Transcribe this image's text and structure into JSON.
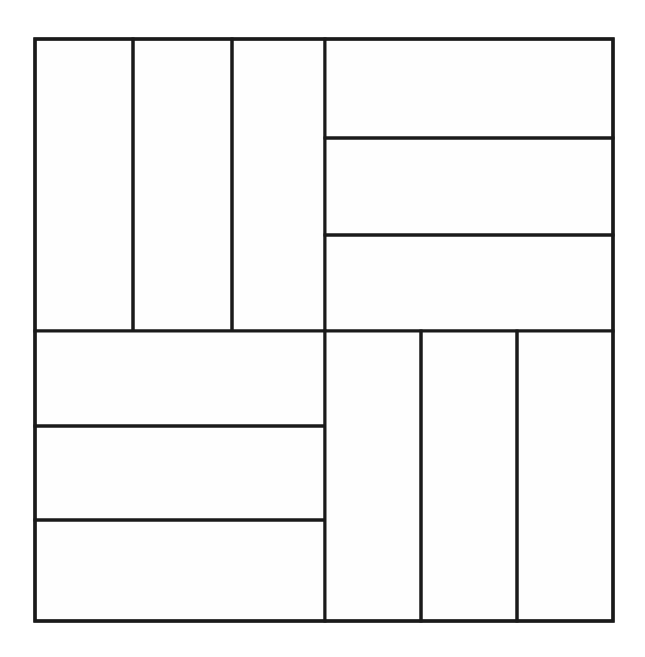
{
  "figure": {
    "canvas_width": 645,
    "canvas_height": 657,
    "background_color": "#ffffff"
  },
  "style": {
    "stroke_color": "#1a1a1a",
    "outer_stroke_width": 3.4,
    "inner_stroke_width": 3.0,
    "fill_color": "#fefefe",
    "line_cap": "square",
    "line_join": "miter"
  },
  "geometry": {
    "outer_square": {
      "x": 35,
      "y": 39,
      "width": 578,
      "height": 582
    },
    "center_x": 325,
    "center_y": 331,
    "left": 35,
    "right": 613,
    "top": 39,
    "bottom": 621
  },
  "quadrants": [
    {
      "name": "top-left",
      "orientation": "vertical",
      "cell_count": 3,
      "bounds": {
        "x": 35,
        "y": 39,
        "width": 290,
        "height": 292
      },
      "dividers": [
        133,
        232
      ],
      "cells": [
        {
          "id": "tl-1",
          "x": 35,
          "y": 39,
          "width": 98,
          "height": 292
        },
        {
          "id": "tl-2",
          "x": 133,
          "y": 39,
          "width": 99,
          "height": 292
        },
        {
          "id": "tl-3",
          "x": 232,
          "y": 39,
          "width": 93,
          "height": 292
        }
      ]
    },
    {
      "name": "top-right",
      "orientation": "horizontal",
      "cell_count": 3,
      "bounds": {
        "x": 325,
        "y": 39,
        "width": 288,
        "height": 292
      },
      "dividers": [
        138,
        235
      ],
      "cells": [
        {
          "id": "tr-1",
          "x": 325,
          "y": 39,
          "width": 288,
          "height": 99
        },
        {
          "id": "tr-2",
          "x": 325,
          "y": 138,
          "width": 288,
          "height": 97
        },
        {
          "id": "tr-3",
          "x": 325,
          "y": 235,
          "width": 288,
          "height": 96
        }
      ]
    },
    {
      "name": "bottom-left",
      "orientation": "horizontal",
      "cell_count": 3,
      "bounds": {
        "x": 35,
        "y": 331,
        "width": 290,
        "height": 290
      },
      "dividers": [
        426,
        520
      ],
      "cells": [
        {
          "id": "bl-1",
          "x": 35,
          "y": 331,
          "width": 290,
          "height": 95
        },
        {
          "id": "bl-2",
          "x": 35,
          "y": 426,
          "width": 290,
          "height": 94
        },
        {
          "id": "bl-3",
          "x": 35,
          "y": 520,
          "width": 290,
          "height": 101
        }
      ]
    },
    {
      "name": "bottom-right",
      "orientation": "vertical",
      "cell_count": 3,
      "bounds": {
        "x": 325,
        "y": 331,
        "width": 288,
        "height": 290
      },
      "dividers": [
        421,
        517
      ],
      "cells": [
        {
          "id": "br-1",
          "x": 325,
          "y": 331,
          "width": 96,
          "height": 290
        },
        {
          "id": "br-2",
          "x": 421,
          "y": 331,
          "width": 96,
          "height": 290
        },
        {
          "id": "br-3",
          "x": 517,
          "y": 331,
          "width": 96,
          "height": 290
        }
      ]
    }
  ],
  "labels": {
    "none_visible": "",
    "annotation_count": 0
  }
}
